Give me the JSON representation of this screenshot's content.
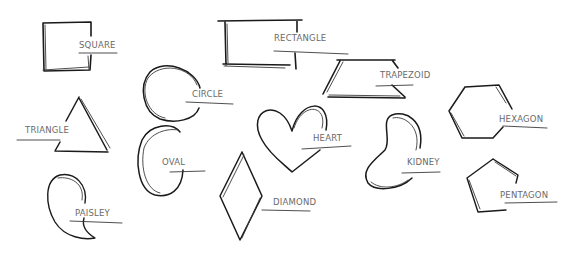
{
  "style": {
    "ink_color": "#1a1a1a",
    "label_color": "#6a6a6a",
    "background": "#ffffff"
  },
  "shapes": [
    {
      "id": "square",
      "label": "SQUARE"
    },
    {
      "id": "rectangle",
      "label": "RECTANGLE"
    },
    {
      "id": "circle",
      "label": "CIRCLE"
    },
    {
      "id": "trapezoid",
      "label": "TRAPEZOID"
    },
    {
      "id": "triangle",
      "label": "TRIANGLE"
    },
    {
      "id": "heart",
      "label": "HEART"
    },
    {
      "id": "hexagon",
      "label": "HEXAGON"
    },
    {
      "id": "oval",
      "label": "OVAL"
    },
    {
      "id": "kidney",
      "label": "KIDNEY"
    },
    {
      "id": "paisley",
      "label": "PAISLEY"
    },
    {
      "id": "diamond",
      "label": "DIAMOND"
    },
    {
      "id": "pentagon",
      "label": "PENTAGON"
    }
  ]
}
